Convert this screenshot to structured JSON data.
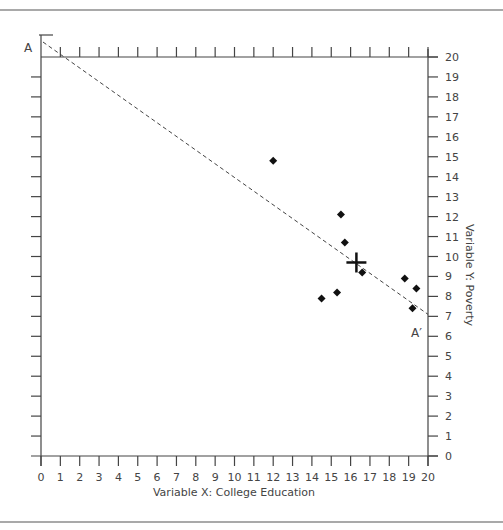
{
  "chart_data": {
    "type": "scatter",
    "title": "",
    "xlabel": "Variable X: College Education",
    "ylabel": "Variable Y: Poverty",
    "xlim": [
      0,
      20
    ],
    "ylim": [
      0,
      20
    ],
    "x_ticks": [
      0,
      1,
      2,
      3,
      4,
      5,
      6,
      7,
      8,
      9,
      10,
      11,
      12,
      13,
      14,
      15,
      16,
      17,
      18,
      19,
      20
    ],
    "y_ticks": [
      0,
      1,
      2,
      3,
      4,
      5,
      6,
      7,
      8,
      9,
      10,
      11,
      12,
      13,
      14,
      15,
      16,
      17,
      18,
      19,
      20
    ],
    "grid": false,
    "legend": null,
    "series": [
      {
        "name": "observations",
        "marker": "diamond",
        "points": [
          {
            "x": 12.0,
            "y": 14.8
          },
          {
            "x": 15.5,
            "y": 12.1
          },
          {
            "x": 15.7,
            "y": 10.7
          },
          {
            "x": 16.6,
            "y": 9.2
          },
          {
            "x": 14.5,
            "y": 7.9
          },
          {
            "x": 15.3,
            "y": 8.2
          },
          {
            "x": 18.8,
            "y": 8.9
          },
          {
            "x": 19.4,
            "y": 8.4
          },
          {
            "x": 19.2,
            "y": 7.4
          }
        ]
      }
    ],
    "mean_point": {
      "x": 16.3,
      "y": 9.7,
      "marker": "cross"
    },
    "regression_line": {
      "style": "dashed",
      "start": {
        "x": 0,
        "y": 20.75,
        "label": "A"
      },
      "end": {
        "x": 20,
        "y": 7.1,
        "label": "A′"
      }
    }
  },
  "labels": {
    "line_start": "A",
    "line_end": "A′",
    "x_axis_title": "Variable X: College Education",
    "y_axis_title": "Variable Y: Poverty"
  }
}
